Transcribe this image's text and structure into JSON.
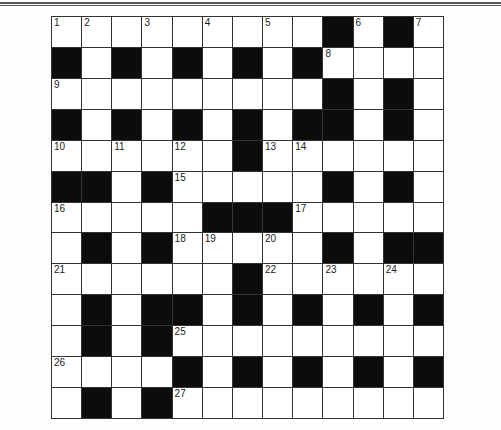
{
  "puzzle": {
    "type": "crossword",
    "rows": 13,
    "cols": 13,
    "grid": [
      "WWWWWWWWWBWBW",
      "BWBWBWBWBWWWW",
      "WWWWWWWWWBWBW",
      "BWBWBWBWBBWBW",
      "WWWWWWBWWWWWW",
      "BBWBWWWWWBWBW",
      "WWWWWBBBWWWWW",
      "WBWBWWWWWBWBB",
      "WWWWWWBWWWWWW",
      "WBWBBWBWBWBWB",
      "WBWBWWWWWWWWW",
      "WWWWBWBWBWBWB",
      "WBWBWWWWWWWWW"
    ],
    "numbers": [
      {
        "n": "1",
        "r": 0,
        "c": 0
      },
      {
        "n": "2",
        "r": 0,
        "c": 1
      },
      {
        "n": "3",
        "r": 0,
        "c": 3
      },
      {
        "n": "4",
        "r": 0,
        "c": 5
      },
      {
        "n": "5",
        "r": 0,
        "c": 7
      },
      {
        "n": "6",
        "r": 0,
        "c": 10
      },
      {
        "n": "7",
        "r": 0,
        "c": 12
      },
      {
        "n": "8",
        "r": 1,
        "c": 9
      },
      {
        "n": "9",
        "r": 2,
        "c": 0
      },
      {
        "n": "10",
        "r": 4,
        "c": 0
      },
      {
        "n": "11",
        "r": 4,
        "c": 2
      },
      {
        "n": "12",
        "r": 4,
        "c": 4
      },
      {
        "n": "13",
        "r": 4,
        "c": 7
      },
      {
        "n": "14",
        "r": 4,
        "c": 8
      },
      {
        "n": "15",
        "r": 5,
        "c": 4
      },
      {
        "n": "16",
        "r": 6,
        "c": 0
      },
      {
        "n": "17",
        "r": 6,
        "c": 8
      },
      {
        "n": "18",
        "r": 7,
        "c": 4
      },
      {
        "n": "19",
        "r": 7,
        "c": 5
      },
      {
        "n": "20",
        "r": 7,
        "c": 7
      },
      {
        "n": "21",
        "r": 8,
        "c": 0
      },
      {
        "n": "22",
        "r": 8,
        "c": 7
      },
      {
        "n": "23",
        "r": 8,
        "c": 9
      },
      {
        "n": "24",
        "r": 8,
        "c": 11
      },
      {
        "n": "25",
        "r": 10,
        "c": 4
      },
      {
        "n": "26",
        "r": 11,
        "c": 0
      },
      {
        "n": "27",
        "r": 12,
        "c": 4
      }
    ],
    "colors": {
      "black_cell": "#0c0c0c",
      "white_cell": "#ffffff",
      "grid_line": "#333333"
    }
  }
}
